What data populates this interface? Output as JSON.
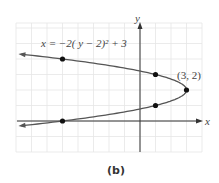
{
  "chart_data": {
    "type": "line",
    "title": "",
    "caption": "(b)",
    "equation_label": "x = −2( y − 2)² + 3",
    "xlabel": "x",
    "ylabel": "y",
    "xlim": [
      -8,
      4
    ],
    "ylim": [
      -2,
      6
    ],
    "grid": true,
    "series": [
      {
        "name": "x = -2(y-2)^2 + 3",
        "function": "x = -2(y-2)^2 + 3",
        "marked_points": [
          {
            "x": -5,
            "y": 4
          },
          {
            "x": 1,
            "y": 3
          },
          {
            "x": 3,
            "y": 2
          },
          {
            "x": 1,
            "y": 1
          },
          {
            "x": -5,
            "y": 0
          }
        ]
      }
    ],
    "annotations": [
      {
        "text": "(3, 2)",
        "x": 3,
        "y": 2
      }
    ]
  },
  "labels": {
    "equation": "x = −2( y − 2)² + 3",
    "vertex": "(3, 2)",
    "x_axis": "x",
    "y_axis": "y",
    "caption": "(b)"
  }
}
